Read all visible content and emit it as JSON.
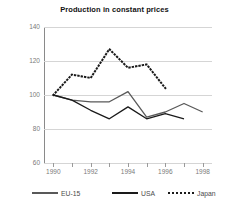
{
  "chart_data": {
    "type": "line",
    "title": "Production in constant prices",
    "xlabel": "",
    "ylabel": "",
    "x": [
      1990,
      1991,
      1992,
      1993,
      1994,
      1995,
      1996,
      1997,
      1998
    ],
    "xlim": [
      1989.5,
      1998.5
    ],
    "ylim": [
      60,
      140
    ],
    "ytick_labels": [
      "140",
      "120",
      "100",
      "80",
      "60"
    ],
    "ytick_values": [
      140,
      120,
      100,
      80,
      60
    ],
    "xtick_values": [
      1990,
      1991,
      1992,
      1993,
      1994,
      1995,
      1996,
      1997,
      1998
    ],
    "xtick_labels": [
      "1990",
      "",
      "1992",
      "",
      "1994",
      "",
      "1996",
      "",
      "1998"
    ],
    "grid": true,
    "legend_position": "bottom",
    "series": [
      {
        "name": "EU-15",
        "color": "#595959",
        "style": "solid",
        "x": [
          1990,
          1991,
          1992,
          1993,
          1994,
          1995,
          1996,
          1997,
          1998
        ],
        "values": [
          100,
          97,
          96,
          96,
          102,
          87,
          90,
          95,
          90
        ]
      },
      {
        "name": "USA",
        "color": "#1a1a1a",
        "style": "solid",
        "x": [
          1990,
          1991,
          1992,
          1993,
          1994,
          1995,
          1996,
          1997
        ],
        "values": [
          100,
          97,
          91,
          86,
          93,
          86,
          89,
          86
        ]
      },
      {
        "name": "Japan",
        "color": "#1a1a1a",
        "style": "dotted",
        "x": [
          1990,
          1991,
          1992,
          1993,
          1994,
          1995,
          1996
        ],
        "values": [
          100,
          112,
          110,
          127,
          116,
          118,
          104
        ]
      }
    ]
  },
  "legend": {
    "items": [
      {
        "label": "EU-15"
      },
      {
        "label": "USA"
      },
      {
        "label": "Japan"
      }
    ]
  }
}
